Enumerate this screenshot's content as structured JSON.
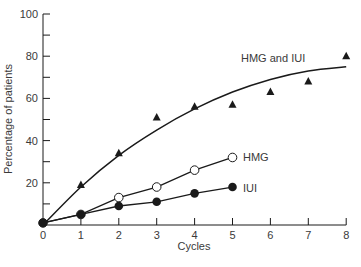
{
  "chart_data": {
    "type": "line",
    "title": "",
    "xlabel": "Cycles",
    "ylabel": "Percentage of patients",
    "xlim": [
      0,
      8
    ],
    "ylim": [
      0,
      100
    ],
    "x_ticks": [
      0,
      1,
      2,
      3,
      4,
      5,
      6,
      7,
      8
    ],
    "y_ticks_labeled": [
      20,
      40,
      60,
      80,
      100
    ],
    "y_ticks_minor": [
      10,
      30,
      50,
      70,
      90
    ],
    "grid": false,
    "legend": "inline labels at line ends",
    "series": [
      {
        "name": "HMG and IUI",
        "marker": "filled-triangle",
        "x": [
          0,
          1,
          2,
          3,
          4,
          5,
          6,
          7,
          8
        ],
        "values": [
          1,
          19,
          34,
          51,
          56,
          57,
          63,
          68,
          80
        ],
        "fit_curve": {
          "x": [
            0,
            1,
            2,
            3,
            4,
            5,
            6,
            7,
            8
          ],
          "values": [
            0,
            18,
            33,
            45,
            55,
            63,
            69,
            73,
            75
          ]
        }
      },
      {
        "name": "HMG",
        "marker": "open-circle",
        "x": [
          0,
          1,
          2,
          3,
          4,
          5
        ],
        "values": [
          1,
          5,
          13,
          18,
          26,
          32
        ]
      },
      {
        "name": "IUI",
        "marker": "filled-circle",
        "x": [
          0,
          1,
          2,
          3,
          4,
          5
        ],
        "values": [
          1,
          5,
          9,
          11,
          15,
          18
        ]
      }
    ]
  },
  "labels": {
    "hmg_iui": "HMG and IUI",
    "hmg": "HMG",
    "iui": "IUI",
    "xlabel": "Cycles",
    "ylabel": "Percentage of patients"
  },
  "colors": {
    "ink": "#1a1a1a",
    "text": "#3a3a3a",
    "background": "#ffffff"
  }
}
